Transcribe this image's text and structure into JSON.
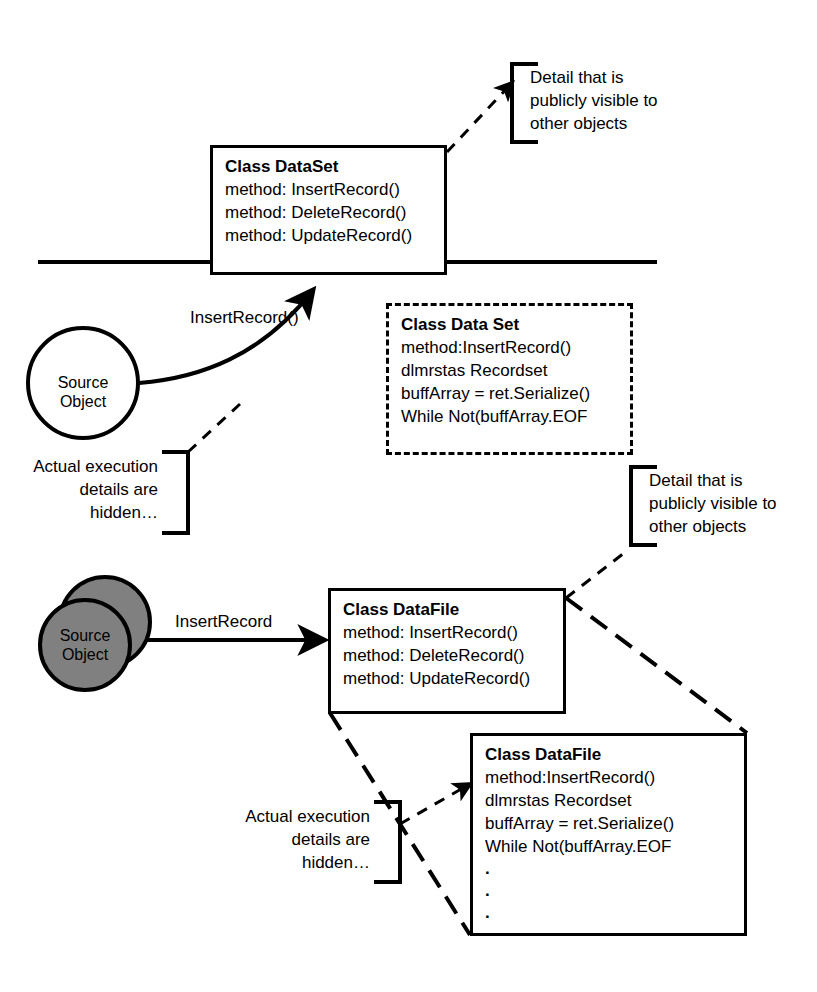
{
  "diagram": {
    "colors": {
      "stroke": "#000000",
      "fill": "#ffffff",
      "object_fill": "#808080",
      "background": "#ffffff"
    },
    "upper": {
      "class_box": {
        "title": "Class DataSet",
        "members": [
          "method: InsertRecord()",
          "method: DeleteRecord()",
          "method: UpdateRecord()"
        ]
      },
      "detail_box": {
        "title": "Class Data Set",
        "members": [
          "method:InsertRecord()",
          "dlmrstas Recordset",
          "buffArray = ret.Serialize()",
          "While Not(buffArray.EOF"
        ]
      },
      "public_callout": [
        "Detail that is",
        "publicly visible to",
        "other objects"
      ],
      "hidden_callout": [
        "Actual execution",
        "details are",
        "hidden…"
      ],
      "source_object": [
        "Source",
        "Object"
      ],
      "message_label": "InsertRecord()"
    },
    "lower": {
      "class_box": {
        "title": "Class DataFile",
        "members": [
          "method: InsertRecord()",
          "method: DeleteRecord()",
          "method: UpdateRecord()"
        ]
      },
      "detail_box": {
        "title": "Class DataFile",
        "members": [
          "method:InsertRecord()",
          "dlmrstas Recordset",
          "buffArray = ret.Serialize()",
          "While Not(buffArray.EOF"
        ],
        "continuation": [
          ".",
          ".",
          "."
        ]
      },
      "public_callout": [
        "Detail that is",
        "publicly visible to",
        "other objects"
      ],
      "hidden_callout": [
        "Actual execution",
        "details are",
        "hidden…"
      ],
      "source_object": [
        "Source",
        "Object"
      ],
      "message_label": "InsertRecord"
    }
  }
}
